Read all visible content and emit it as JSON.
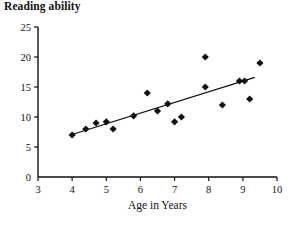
{
  "chart_data": {
    "type": "scatter",
    "title": "Reading ability",
    "xlabel": "Age in Years",
    "ylabel": "Reading ability",
    "xlim": [
      3,
      10
    ],
    "ylim": [
      0,
      25
    ],
    "xticks": [
      3,
      4,
      5,
      6,
      7,
      8,
      9,
      10
    ],
    "yticks": [
      0,
      5,
      10,
      15,
      20,
      25
    ],
    "xtick_labels": [
      "3",
      "4",
      "5",
      "6",
      "7",
      "8",
      "9",
      "10"
    ],
    "ytick_labels": [
      "0",
      "5",
      "10",
      "15",
      "20",
      "25"
    ],
    "grid": false,
    "legend": null,
    "marker": "diamond",
    "marker_color": "#111111",
    "points": [
      {
        "x": 4.0,
        "y": 7.0
      },
      {
        "x": 4.4,
        "y": 8.0
      },
      {
        "x": 4.7,
        "y": 9.0
      },
      {
        "x": 5.0,
        "y": 9.2
      },
      {
        "x": 5.2,
        "y": 8.0
      },
      {
        "x": 5.8,
        "y": 10.2
      },
      {
        "x": 6.2,
        "y": 14.0
      },
      {
        "x": 6.5,
        "y": 11.0
      },
      {
        "x": 6.8,
        "y": 12.2
      },
      {
        "x": 7.0,
        "y": 9.2
      },
      {
        "x": 7.2,
        "y": 10.0
      },
      {
        "x": 7.9,
        "y": 20.0
      },
      {
        "x": 7.9,
        "y": 15.0
      },
      {
        "x": 8.4,
        "y": 12.0
      },
      {
        "x": 8.9,
        "y": 16.0
      },
      {
        "x": 9.05,
        "y": 16.0
      },
      {
        "x": 9.2,
        "y": 13.0
      },
      {
        "x": 9.5,
        "y": 19.0
      }
    ],
    "trendline": {
      "type": "line",
      "color": "#111111",
      "x0": 3.95,
      "y0": 7.0,
      "x1": 9.35,
      "y1": 16.6
    }
  },
  "axes": {
    "x_axis_color": "#111111",
    "y_axis_color": "#111111"
  }
}
